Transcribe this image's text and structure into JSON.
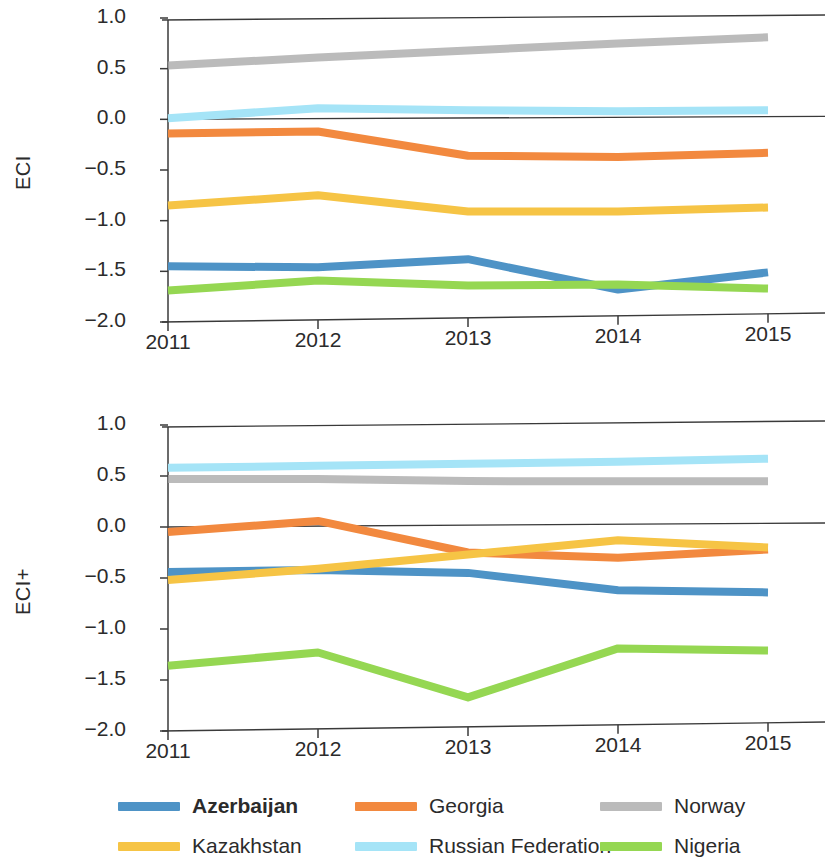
{
  "figure": {
    "background": "#ffffff",
    "series_colors": {
      "Azerbaijan": "#4e93c6",
      "Georgia": "#f2893f",
      "Norway": "#a8a8a8",
      "Kazakhstan": "#f6c445",
      "Russian Federation": "#a5e4f7",
      "Nigeria": "#95d košice"
    }
  },
  "legend": {
    "position": "bottom",
    "items": [
      {
        "label": "Azerbaijan",
        "color": "#4e93c6",
        "bold": true
      },
      {
        "label": "Georgia",
        "color": "#f2893f",
        "bold": false
      },
      {
        "label": "Norway",
        "color": "#a8a8a8",
        "bold": false
      },
      {
        "label": "Kazakhstan",
        "color": "#f6c445",
        "bold": false
      },
      {
        "label": "Russian Federation",
        "color": "#a5e4f7",
        "bold": false
      },
      {
        "label": "Nigeria",
        "color": "#95d752",
        "bold": false
      }
    ]
  },
  "chart_data": [
    {
      "type": "line",
      "title": "",
      "xlabel": "",
      "ylabel": "ECI",
      "categories": [
        "2011",
        "2012",
        "2013",
        "2014",
        "2015"
      ],
      "x": [
        2011,
        2012,
        2013,
        2014,
        2015
      ],
      "ylim": [
        -2.0,
        1.0
      ],
      "yticks": [
        1.0,
        0.5,
        0.0,
        -0.5,
        -1.0,
        -1.5,
        -2.0
      ],
      "ytick_labels": [
        "1.0",
        "0.5",
        "0.0",
        "-0.5",
        "-1.0",
        "-1.5",
        "-2.0"
      ],
      "grid": false,
      "zero_line": true,
      "series": [
        {
          "name": "Azerbaijan",
          "color": "#4e93c6",
          "values": [
            -1.45,
            -1.47,
            -1.4,
            -1.71,
            -1.55
          ]
        },
        {
          "name": "Georgia",
          "color": "#f2893f",
          "values": [
            -0.14,
            -0.13,
            -0.38,
            -0.4,
            -0.37
          ]
        },
        {
          "name": "Norway",
          "color": "#a8a8a8",
          "values": [
            0.53,
            0.6,
            0.66,
            0.72,
            0.77
          ]
        },
        {
          "name": "Kazakhstan",
          "color": "#f6c445",
          "values": [
            -0.85,
            -0.76,
            -0.93,
            -0.94,
            -0.91
          ]
        },
        {
          "name": "Russian Federation",
          "color": "#a5e4f7",
          "values": [
            0.01,
            0.1,
            0.07,
            0.05,
            0.05
          ]
        },
        {
          "name": "Nigeria",
          "color": "#95d752",
          "values": [
            -1.69,
            -1.6,
            -1.66,
            -1.66,
            -1.71
          ]
        }
      ]
    },
    {
      "type": "line",
      "title": "",
      "xlabel": "",
      "ylabel": "ECI+",
      "categories": [
        "2011",
        "2012",
        "2013",
        "2014",
        "2015"
      ],
      "x": [
        2011,
        2012,
        2013,
        2014,
        2015
      ],
      "ylim": [
        -2.0,
        1.0
      ],
      "yticks": [
        1.0,
        0.5,
        0.0,
        -0.5,
        -1.0,
        -1.5,
        -2.0
      ],
      "ytick_labels": [
        "1.0",
        "0.5",
        "0.0",
        "-0.5",
        "-1.0",
        "-1.5",
        "-2.0"
      ],
      "grid": false,
      "zero_line": true,
      "series": [
        {
          "name": "Azerbaijan",
          "color": "#4e93c6",
          "values": [
            -0.44,
            -0.43,
            -0.47,
            -0.65,
            -0.68
          ]
        },
        {
          "name": "Georgia",
          "color": "#f2893f",
          "values": [
            -0.05,
            0.05,
            -0.27,
            -0.33,
            -0.26
          ]
        },
        {
          "name": "Norway",
          "color": "#a8a8a8",
          "values": [
            0.47,
            0.46,
            0.43,
            0.42,
            0.41
          ]
        },
        {
          "name": "Kazakhstan",
          "color": "#f6c445",
          "values": [
            -0.52,
            -0.42,
            -0.29,
            -0.16,
            -0.24
          ]
        },
        {
          "name": "Russian Federation",
          "color": "#a5e4f7",
          "values": [
            0.58,
            0.59,
            0.6,
            0.61,
            0.63
          ]
        },
        {
          "name": "Nigeria",
          "color": "#95d752",
          "values": [
            -1.36,
            -1.24,
            -1.69,
            -1.22,
            -1.25
          ]
        }
      ]
    }
  ]
}
